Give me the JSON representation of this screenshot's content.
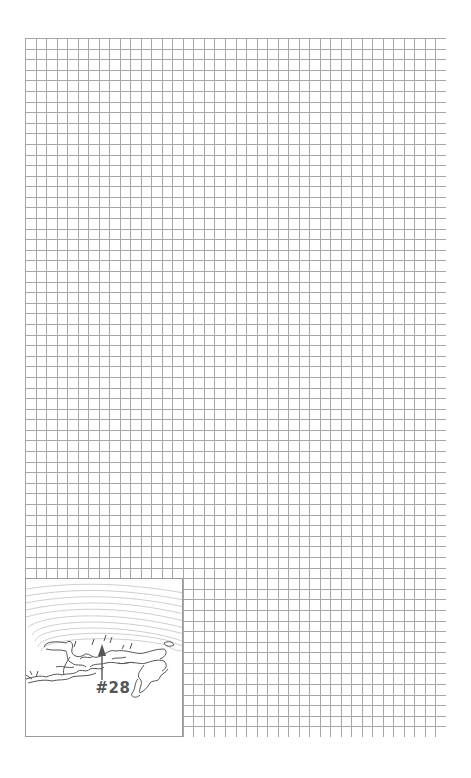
{
  "page": {
    "type": "graph-paper-notebook-page",
    "grid": {
      "columns": 40,
      "rows": 66,
      "line_color": "#a6a6a6",
      "background": "#ffffff"
    }
  },
  "inset_map": {
    "label": "#28",
    "marker": "up-arrow",
    "contour_color": "#b5b5b5",
    "coast_color": "#555555"
  }
}
